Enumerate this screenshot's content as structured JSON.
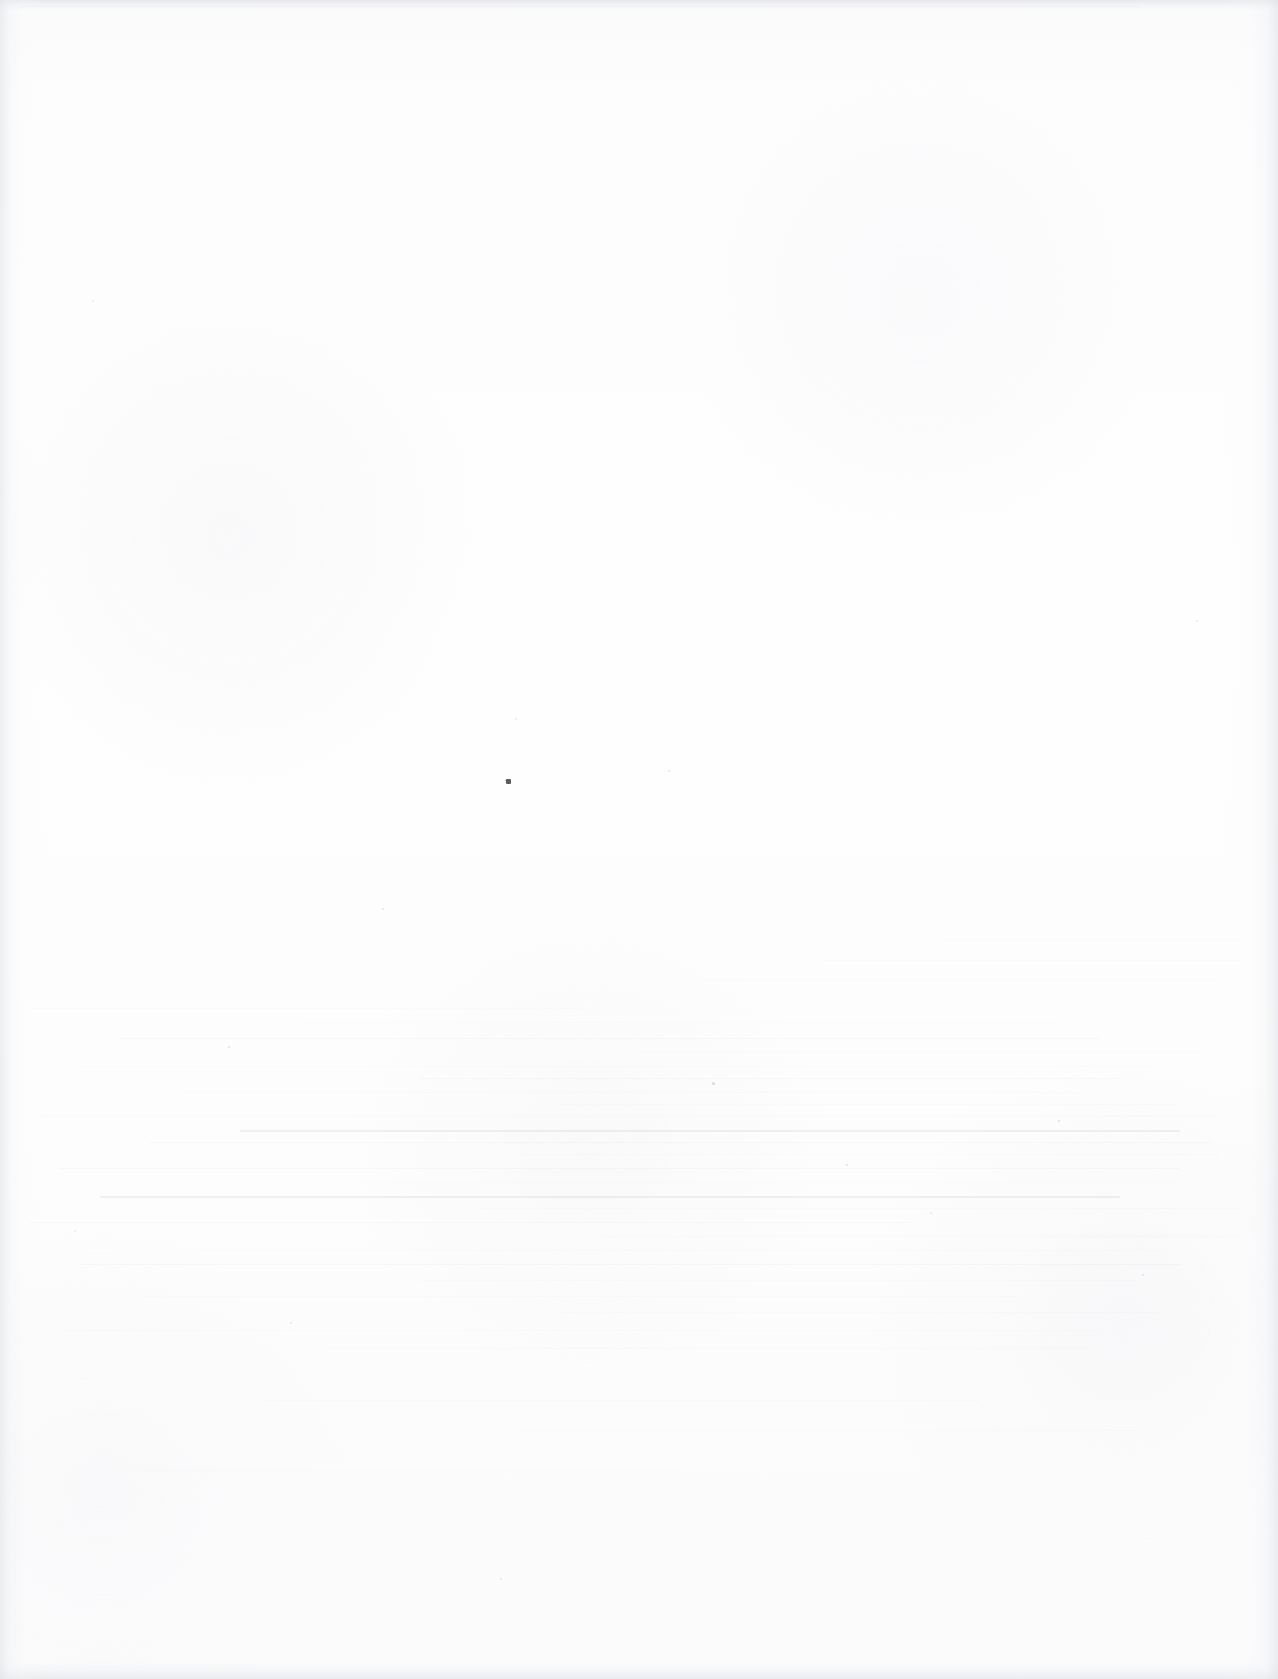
{
  "document": {
    "kind": "scanned-page",
    "page_state": "blank",
    "visible_text": "",
    "width_px": 1278,
    "height_px": 1679
  },
  "appearance": {
    "paper_color": "#fdfdfd",
    "edge_shadow_color": "#e2e4e8",
    "streak_color": "#787c86",
    "ink_speck_color": "#5a5c63"
  },
  "artifacts": {
    "ink_speck": {
      "x": 506,
      "y": 779,
      "size": 5
    },
    "edge_band_top_height": 16,
    "edge_band_bottom_height": 26,
    "ghost_region": {
      "top": 995,
      "height": 370
    },
    "specks": [
      {
        "x": 228,
        "y": 1046,
        "size": 2,
        "opacity": 0.18
      },
      {
        "x": 382,
        "y": 908,
        "size": 2,
        "opacity": 0.14
      },
      {
        "x": 515,
        "y": 718,
        "size": 2,
        "opacity": 0.12
      },
      {
        "x": 668,
        "y": 770,
        "size": 2,
        "opacity": 0.16
      },
      {
        "x": 712,
        "y": 1082,
        "size": 3,
        "opacity": 0.2
      },
      {
        "x": 846,
        "y": 1164,
        "size": 2,
        "opacity": 0.17
      },
      {
        "x": 930,
        "y": 1212,
        "size": 2,
        "opacity": 0.15
      },
      {
        "x": 1058,
        "y": 1120,
        "size": 2,
        "opacity": 0.18
      },
      {
        "x": 1142,
        "y": 1274,
        "size": 2,
        "opacity": 0.14
      },
      {
        "x": 74,
        "y": 1230,
        "size": 2,
        "opacity": 0.13
      },
      {
        "x": 290,
        "y": 1322,
        "size": 2,
        "opacity": 0.12
      },
      {
        "x": 500,
        "y": 1578,
        "size": 2,
        "opacity": 0.12
      },
      {
        "x": 1196,
        "y": 620,
        "size": 2,
        "opacity": 0.12
      },
      {
        "x": 92,
        "y": 300,
        "size": 2,
        "opacity": 0.1
      }
    ],
    "streaks": [
      {
        "top": 1008,
        "left": 28,
        "width": 560,
        "weight": "faint"
      },
      {
        "top": 1022,
        "left": 300,
        "width": 760,
        "weight": "faint"
      },
      {
        "top": 1038,
        "left": 120,
        "width": 980,
        "weight": "normal"
      },
      {
        "top": 1052,
        "left": 640,
        "width": 560,
        "weight": "faint"
      },
      {
        "top": 1066,
        "left": 76,
        "width": 1080,
        "weight": "faint"
      },
      {
        "top": 1078,
        "left": 420,
        "width": 700,
        "weight": "normal"
      },
      {
        "top": 1092,
        "left": 180,
        "width": 900,
        "weight": "faint"
      },
      {
        "top": 1104,
        "left": 560,
        "width": 620,
        "weight": "faint"
      },
      {
        "top": 1116,
        "left": 40,
        "width": 1180,
        "weight": "faint"
      },
      {
        "top": 1130,
        "left": 240,
        "width": 940,
        "weight": "strong"
      },
      {
        "top": 1142,
        "left": 150,
        "width": 1060,
        "weight": "normal"
      },
      {
        "top": 1154,
        "left": 520,
        "width": 700,
        "weight": "faint"
      },
      {
        "top": 1168,
        "left": 60,
        "width": 1120,
        "weight": "normal"
      },
      {
        "top": 1182,
        "left": 360,
        "width": 820,
        "weight": "faint"
      },
      {
        "top": 1196,
        "left": 100,
        "width": 1020,
        "weight": "strong"
      },
      {
        "top": 1208,
        "left": 480,
        "width": 760,
        "weight": "faint"
      },
      {
        "top": 1222,
        "left": 30,
        "width": 880,
        "weight": "normal"
      },
      {
        "top": 1236,
        "left": 600,
        "width": 640,
        "weight": "faint"
      },
      {
        "top": 1250,
        "left": 200,
        "width": 960,
        "weight": "faint"
      },
      {
        "top": 1264,
        "left": 80,
        "width": 1100,
        "weight": "normal"
      },
      {
        "top": 1280,
        "left": 420,
        "width": 720,
        "weight": "faint"
      },
      {
        "top": 1296,
        "left": 140,
        "width": 880,
        "weight": "faint"
      },
      {
        "top": 1312,
        "left": 560,
        "width": 600,
        "weight": "faint"
      },
      {
        "top": 1330,
        "left": 60,
        "width": 1040,
        "weight": "faint"
      },
      {
        "top": 1348,
        "left": 330,
        "width": 760,
        "weight": "faint"
      },
      {
        "top": 980,
        "left": 700,
        "width": 520,
        "weight": "faint"
      },
      {
        "top": 960,
        "left": 820,
        "width": 420,
        "weight": "faint"
      },
      {
        "top": 940,
        "left": 940,
        "width": 300,
        "weight": "faint"
      },
      {
        "top": 1400,
        "left": 260,
        "width": 720,
        "weight": "faint"
      },
      {
        "top": 1430,
        "left": 520,
        "width": 620,
        "weight": "faint"
      },
      {
        "top": 1470,
        "left": 140,
        "width": 540,
        "weight": "faint"
      },
      {
        "top": 6,
        "left": 20,
        "width": 1120,
        "weight": "normal"
      },
      {
        "top": 14,
        "left": 160,
        "width": 860,
        "weight": "faint"
      }
    ]
  }
}
